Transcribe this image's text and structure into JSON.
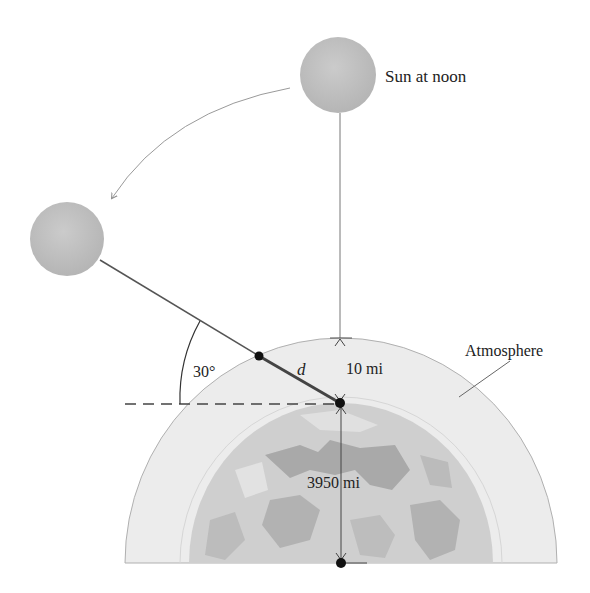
{
  "diagram": {
    "labels": {
      "sun_noon": "Sun at noon",
      "atmosphere": "Atmosphere",
      "angle": "30°",
      "distance": "d",
      "atmosphere_thickness": "10 mi",
      "earth_radius": "3950 mi"
    },
    "colors": {
      "sun": "#bdbdbd",
      "atmosphere": "#ececec",
      "earth": "#cfcfcf",
      "earth_land": "#a8a8a8",
      "line": "#555555",
      "dot": "#111111"
    }
  }
}
